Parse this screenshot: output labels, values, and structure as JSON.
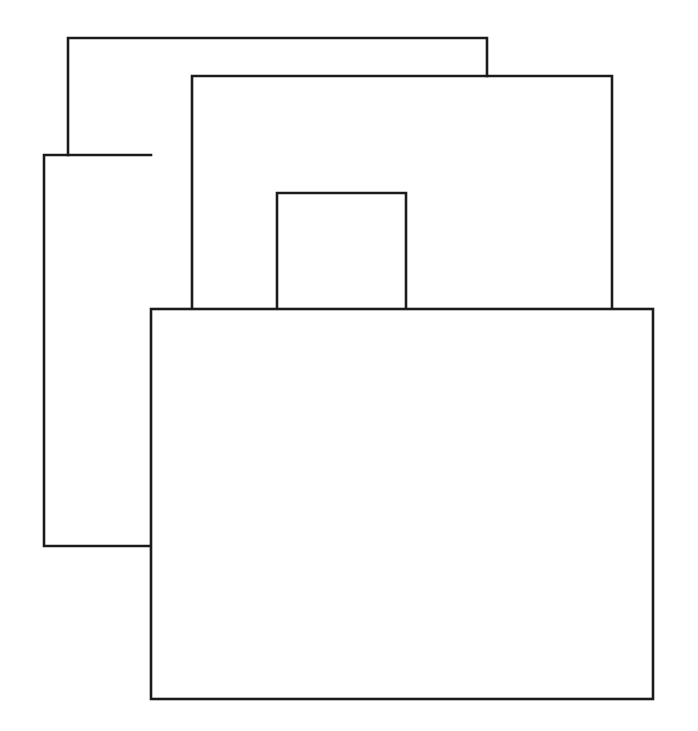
{
  "page": {
    "width": 698,
    "height": 731,
    "background_color": "#ffffff",
    "ink_color": "#1b1b1b"
  },
  "caption": {
    "text": "Figure 5.3  Overlapping windows: parts are hidden; only one is on top.",
    "note": "clipped by top edge of page; only the bottom sliver of the glyphs is visible"
  },
  "figure": {
    "stroke_color": "#1b1b1b",
    "stroke_width": 2.6,
    "fill_color": "#ffffff",
    "shapes": [
      {
        "name": "window-back",
        "label": "Rectangle 1 (rearmost)",
        "x": 68,
        "y": 37,
        "width": 420,
        "height": 350,
        "z": 1,
        "visible_path": "M 68 154 L 68 37 L 488 37 L 488 75"
      },
      {
        "name": "window-second",
        "label": "Rectangle 2",
        "x": 192,
        "y": 75,
        "width": 421,
        "height": 330,
        "z": 2,
        "visible_path": "M 192 309 L 192 75 L 613 75 L 613 309"
      },
      {
        "name": "window-left",
        "label": "Rectangle 3 (left side panel)",
        "x": 43,
        "y": 154,
        "width": 108,
        "height": 392,
        "z": 3,
        "visible_path": "M 43 154 L 43 546 L 151 546 M 43 154 L 151 154"
      },
      {
        "name": "window-small",
        "label": "Rectangle 4 (small tab)",
        "x": 276,
        "y": 192,
        "width": 130,
        "height": 130,
        "z": 4,
        "visible_path": "M 276 309 L 276 192 L 406 192 L 406 309"
      },
      {
        "name": "window-front",
        "label": "Rectangle 5 (frontmost, largest)",
        "x": 151,
        "y": 309,
        "width": 502,
        "height": 390,
        "z": 5,
        "visible_path": "M 151 309 L 653 309 L 653 699 L 151 699 Z"
      }
    ]
  }
}
